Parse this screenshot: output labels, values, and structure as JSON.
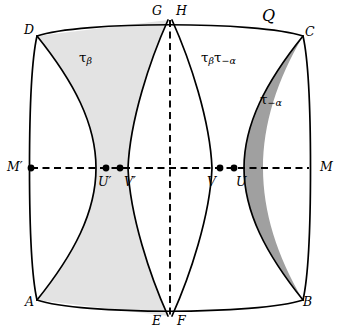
{
  "figure": {
    "title_label": "Q",
    "background_color": "#ffffff",
    "stroke_color": "#000000",
    "fill_light": "#e3e3e3",
    "fill_dark": "#a0a0a0",
    "fill_white": "#ffffff",
    "width": 338,
    "height": 333
  },
  "region_labels": {
    "left": {
      "symbol": "τ",
      "subscript": "β"
    },
    "middle": {
      "symbol_a": "τ",
      "subscript_a": "β",
      "symbol_b": "τ",
      "subscript_b": "−α"
    },
    "right": {
      "symbol": "τ",
      "subscript": "−α"
    }
  },
  "vertices": {
    "A": "A",
    "B": "B",
    "C": "C",
    "D": "D",
    "E": "E",
    "F": "F",
    "G": "G",
    "H": "H",
    "Q": "Q"
  },
  "axis_points": {
    "M_prime": "M′",
    "U_prime": "U′",
    "V_prime": "V′",
    "V": "V",
    "U": "U",
    "M": "M"
  }
}
